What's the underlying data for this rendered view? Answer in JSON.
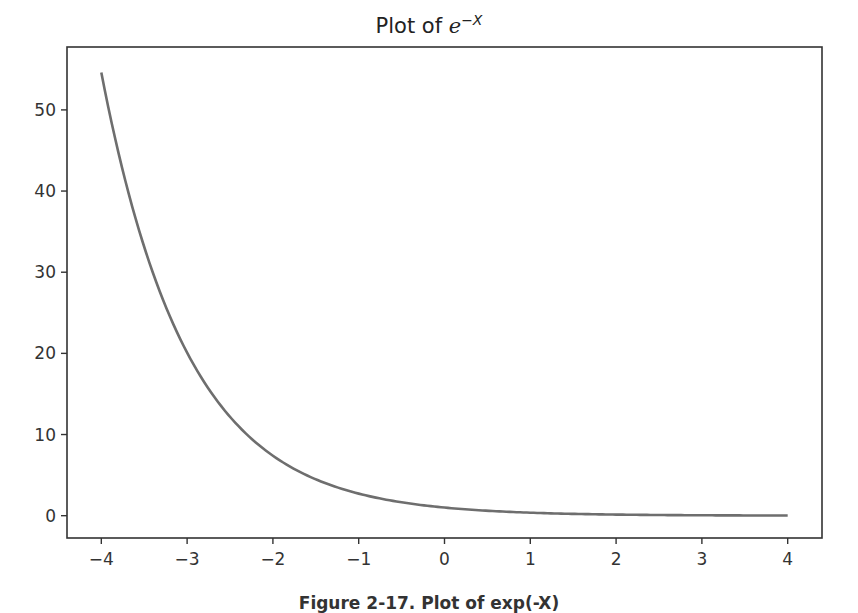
{
  "chart_data": {
    "type": "line",
    "title_parts": {
      "prefix": "Plot of ",
      "base": "e",
      "exponent": "−X"
    },
    "xlabel": "",
    "ylabel": "",
    "xlim": [
      -4.4,
      4.4
    ],
    "ylim": [
      -2.75,
      57.75
    ],
    "xticks": [
      -4,
      -3,
      -2,
      -1,
      0,
      1,
      2,
      3,
      4
    ],
    "xtick_labels": [
      "−4",
      "−3",
      "−2",
      "−1",
      "0",
      "1",
      "2",
      "3",
      "4"
    ],
    "yticks": [
      0,
      10,
      20,
      30,
      40,
      50
    ],
    "ytick_labels": [
      "0",
      "10",
      "20",
      "30",
      "40",
      "50"
    ],
    "grid": false,
    "legend": null,
    "series": [
      {
        "name": "exp(-x)",
        "color": "#6e6e6e",
        "x": [
          -4,
          -3.5,
          -3,
          -2.5,
          -2,
          -1.5,
          -1,
          -0.5,
          0,
          0.5,
          1,
          1.5,
          2,
          2.5,
          3,
          3.5,
          4
        ],
        "y": [
          54.6,
          33.12,
          20.09,
          12.18,
          7.39,
          4.48,
          2.72,
          1.65,
          1.0,
          0.61,
          0.37,
          0.22,
          0.14,
          0.08,
          0.05,
          0.03,
          0.02
        ]
      }
    ]
  },
  "caption": "Figure 2-17. Plot of exp(-X)"
}
